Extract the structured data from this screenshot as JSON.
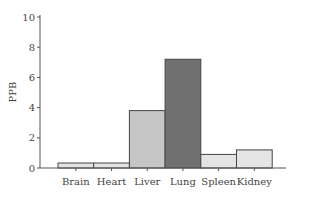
{
  "chart_data": {
    "type": "bar",
    "title": "",
    "xlabel": "",
    "ylabel": "PPB",
    "ylim": [
      0,
      10
    ],
    "yticks": [
      0,
      2,
      4,
      6,
      8,
      10
    ],
    "grid": false,
    "legend": null,
    "categories": [
      "Brain",
      "Heart",
      "Liver",
      "Lung",
      "Spleen",
      "Kidney"
    ],
    "values": [
      0.33,
      0.33,
      3.8,
      7.2,
      0.9,
      1.2
    ],
    "colors": [
      "#e4e4e4",
      "#e4e4e4",
      "#c6c6c6",
      "#707070",
      "#e4e4e4",
      "#e4e4e4"
    ]
  }
}
